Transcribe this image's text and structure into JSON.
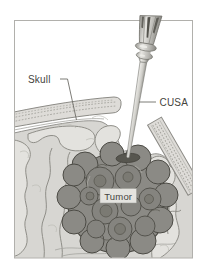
{
  "figure": {
    "type": "medical-illustration",
    "labels": {
      "skull": "Skull",
      "cusa": "CUSA",
      "tumor": "Tumor"
    },
    "colors": {
      "background": "#ffffff",
      "frame_border": "#b1b0ac",
      "brain_tissue": "#d7d6d2",
      "gyrus_highlight": "#e3e2de",
      "sulcus_line": "#8f8e88",
      "skull_bone": "#dedcd8",
      "skull_stipple": "#a3a29c",
      "tumor_fill": "#8b8a85",
      "tumor_outline": "#4c4b45",
      "instrument_metal": "#cfcec9",
      "label_text": "#454440"
    }
  }
}
